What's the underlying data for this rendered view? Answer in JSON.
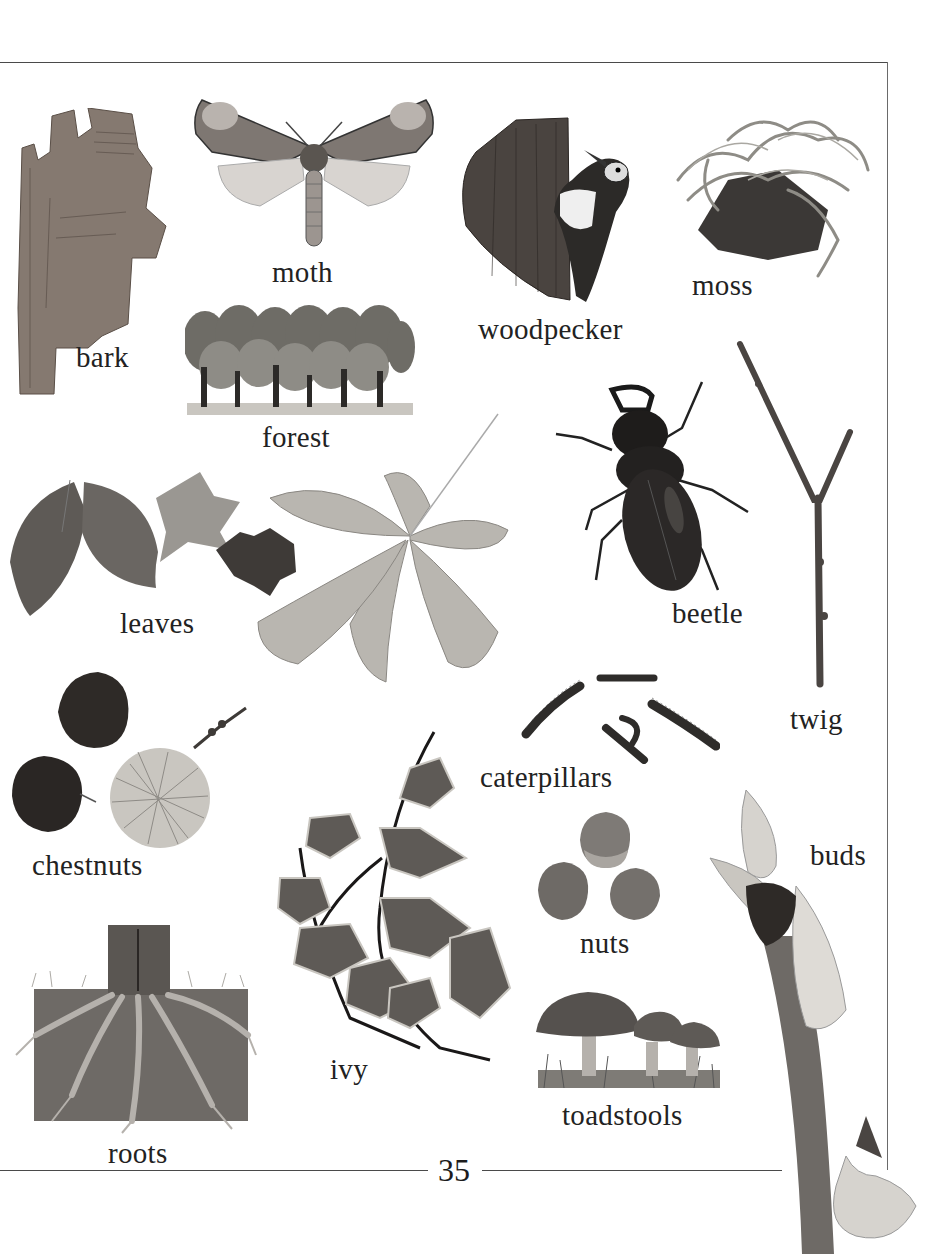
{
  "page": {
    "number": "35",
    "theme": "forest",
    "items": [
      {
        "id": "bark",
        "label": "bark"
      },
      {
        "id": "moth",
        "label": "moth"
      },
      {
        "id": "woodpecker",
        "label": "woodpecker"
      },
      {
        "id": "moss",
        "label": "moss"
      },
      {
        "id": "forest",
        "label": "forest"
      },
      {
        "id": "leaves",
        "label": "leaves"
      },
      {
        "id": "beetle",
        "label": "beetle"
      },
      {
        "id": "twig",
        "label": "twig"
      },
      {
        "id": "caterpillars",
        "label": "caterpillars"
      },
      {
        "id": "chestnuts",
        "label": "chestnuts"
      },
      {
        "id": "ivy",
        "label": "ivy"
      },
      {
        "id": "nuts",
        "label": "nuts"
      },
      {
        "id": "buds",
        "label": "buds"
      },
      {
        "id": "roots",
        "label": "roots"
      },
      {
        "id": "toadstools",
        "label": "toadstools"
      }
    ]
  },
  "colors": {
    "background": "#ffffff",
    "text": "#222222",
    "rule": "#4a4a4a"
  }
}
